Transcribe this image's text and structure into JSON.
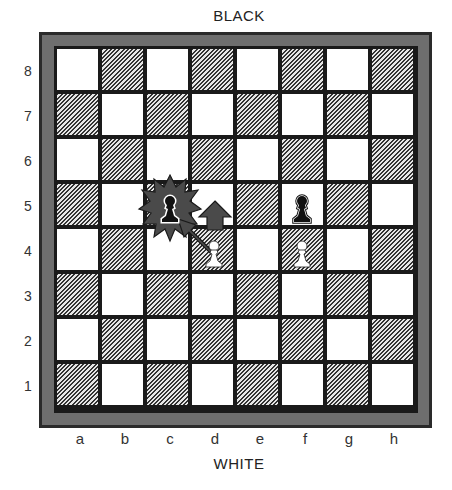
{
  "labels": {
    "top": "BLACK",
    "bottom": "WHITE",
    "ranks": [
      "8",
      "7",
      "6",
      "5",
      "4",
      "3",
      "2",
      "1"
    ],
    "files": [
      "a",
      "b",
      "c",
      "d",
      "e",
      "f",
      "g",
      "h"
    ]
  },
  "board": {
    "light_square_color": "#ffffff",
    "dark_square_pattern": "diagonal-hatch",
    "frame_color": "#2a2a2a",
    "mat_color": "#6e6e6e",
    "pieces": [
      {
        "square": "c5",
        "color": "black",
        "type": "pawn",
        "highlight": "starburst"
      },
      {
        "square": "f5",
        "color": "black",
        "type": "pawn"
      },
      {
        "square": "d4",
        "color": "white",
        "type": "pawn"
      },
      {
        "square": "f4",
        "color": "white",
        "type": "pawn"
      }
    ],
    "arrows": [
      {
        "from": "d4",
        "to": "c5",
        "kind": "capture-diagonal"
      },
      {
        "from": "d4",
        "to": "d5",
        "kind": "advance"
      }
    ]
  }
}
